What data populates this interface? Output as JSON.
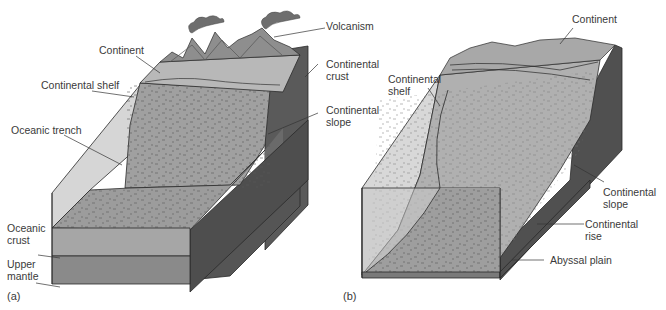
{
  "figure": {
    "panels": [
      {
        "id": "a",
        "tag": "(a)",
        "title": "Active continental margin",
        "labels": {
          "volcanism": "Volcanism",
          "continent": "Continent",
          "continental_shelf": "Continental shelf",
          "continental_crust": "Continental\ncrust",
          "continental_slope": "Continental\nslope",
          "oceanic_trench": "Oceanic trench",
          "oceanic_crust": "Oceanic\ncrust",
          "upper_mantle": "Upper\nmantle"
        }
      },
      {
        "id": "b",
        "tag": "(b)",
        "title": "Passive continental margin",
        "labels": {
          "continent": "Continent",
          "continental_shelf": "Continental\nshelf",
          "continental_slope": "Continental\nslope",
          "continental_rise": "Continental\nrise",
          "abyssal_plain": "Abyssal plain"
        }
      }
    ],
    "colors": {
      "water_face": "#d6d6d6",
      "seafloor_top": "#9a9a9a",
      "shelf_top": "#b4b4b4",
      "crust_side": "#5c5c5c",
      "crust_dark": "#4a4a4a",
      "oceanic_crust": "#a4a4a4",
      "upper_mantle": "#8c8c8c",
      "mountain": "#8a8a8a",
      "smoke": "#6e6e6e",
      "outline": "#2a2a2a",
      "label_text": "#3a3a3a"
    }
  }
}
